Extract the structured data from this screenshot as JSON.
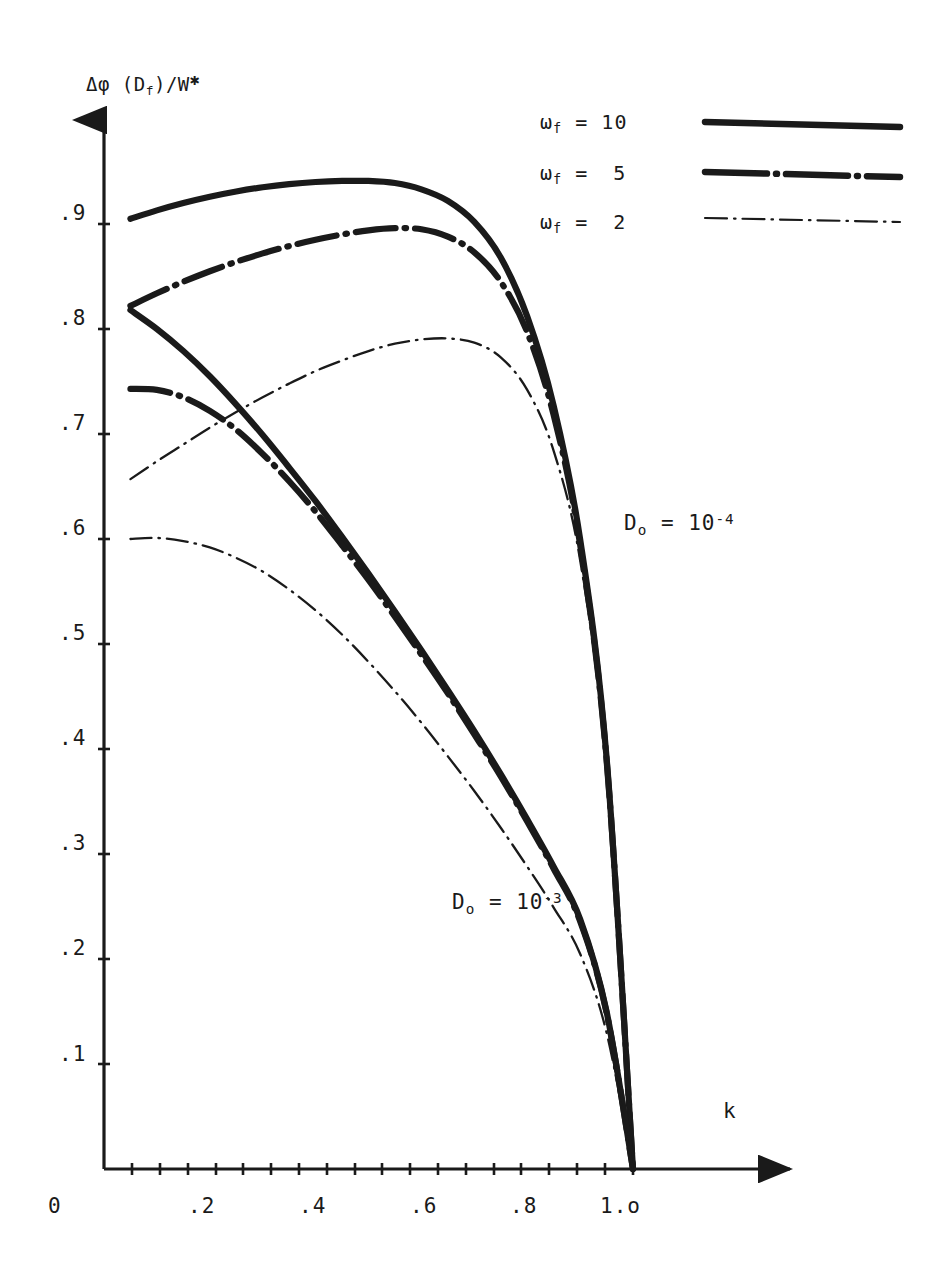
{
  "figure": {
    "width": 939,
    "height": 1277,
    "background": "#ffffff",
    "ink_color": "#1a1a1a"
  },
  "axis": {
    "y_label_prefix": "Δφ (D",
    "y_label_sub": "f",
    "y_label_mid": ")/W",
    "y_label_star": "✱",
    "x_label": "k",
    "origin_label": "0"
  },
  "chart_data": {
    "type": "line",
    "title": "",
    "xlabel": "k",
    "ylabel": "Δφ (D_f)/W*",
    "xlim": [
      0,
      1.15
    ],
    "ylim": [
      0,
      1.0
    ],
    "grid": false,
    "legend_position": "top-right",
    "x_ticks": [
      0,
      0.2,
      0.4,
      0.6,
      0.8,
      1.0
    ],
    "x_tick_labels": [
      "0",
      ".2",
      ".4",
      ".6",
      ".8",
      "1.o"
    ],
    "x_minor_tick_step": 0.05,
    "y_ticks": [
      0.1,
      0.2,
      0.3,
      0.4,
      0.5,
      0.6,
      0.7,
      0.8,
      0.9
    ],
    "y_tick_labels": [
      ".1",
      ".2",
      ".3",
      ".4",
      ".5",
      ".6",
      ".7",
      ".8",
      ".9"
    ],
    "annotations": [
      {
        "id": "annot-d0-1e-4",
        "text_prefix": "D",
        "text_sub": "o",
        "text_mid": " = 10",
        "text_sup": "-4",
        "x_px": 624,
        "y_px": 512
      },
      {
        "id": "annot-d0-1e-3",
        "text_prefix": "D",
        "text_sub": "o",
        "text_mid": " = 10",
        "text_sup": "-3",
        "x_px": 452,
        "y_px": 891
      }
    ],
    "legend": [
      {
        "label_prefix": "ω",
        "label_sub": "f",
        "label_eq": " = ",
        "label_value": "10",
        "style": "solid-thick",
        "width": 6.5
      },
      {
        "label_prefix": "ω",
        "label_sub": "f",
        "label_eq": " = ",
        "label_value": "5",
        "style": "dashdot-thick",
        "width": 6.5
      },
      {
        "label_prefix": "ω",
        "label_sub": "f",
        "label_eq": " = ",
        "label_value": "2",
        "style": "dashdot-thin",
        "width": 2.2
      }
    ],
    "series": [
      {
        "name": "omega_f = 10, D_o = 1e-4",
        "style": "solid-thick",
        "group": "D_o = 10^-4",
        "x": [
          0.05,
          0.1,
          0.15,
          0.2,
          0.25,
          0.3,
          0.35,
          0.4,
          0.45,
          0.5,
          0.55,
          0.6,
          0.65,
          0.7,
          0.75,
          0.8,
          0.85,
          0.9,
          0.95,
          1.0
        ],
        "y": [
          0.905,
          0.913,
          0.92,
          0.926,
          0.931,
          0.935,
          0.938,
          0.94,
          0.941,
          0.941,
          0.939,
          0.933,
          0.922,
          0.902,
          0.868,
          0.812,
          0.727,
          0.6,
          0.392,
          0.0
        ]
      },
      {
        "name": "omega_f = 5, D_o = 1e-4",
        "style": "dashdot-thick",
        "group": "D_o = 10^-4",
        "x": [
          0.05,
          0.1,
          0.15,
          0.2,
          0.25,
          0.3,
          0.35,
          0.4,
          0.45,
          0.5,
          0.55,
          0.6,
          0.65,
          0.7,
          0.75,
          0.8,
          0.85,
          0.9,
          0.95,
          1.0
        ],
        "y": [
          0.822,
          0.834,
          0.845,
          0.855,
          0.864,
          0.872,
          0.879,
          0.885,
          0.89,
          0.894,
          0.896,
          0.895,
          0.888,
          0.873,
          0.845,
          0.797,
          0.718,
          0.595,
          0.39,
          0.0
        ]
      },
      {
        "name": "omega_f = 2, D_o = 1e-4",
        "style": "dashdot-thin",
        "group": "D_o = 10^-4",
        "x": [
          0.05,
          0.1,
          0.15,
          0.2,
          0.25,
          0.3,
          0.35,
          0.4,
          0.45,
          0.5,
          0.55,
          0.6,
          0.65,
          0.7,
          0.75,
          0.8,
          0.85,
          0.9,
          0.95,
          1.0
        ],
        "y": [
          0.657,
          0.674,
          0.69,
          0.706,
          0.721,
          0.735,
          0.748,
          0.76,
          0.77,
          0.779,
          0.786,
          0.79,
          0.791,
          0.787,
          0.773,
          0.742,
          0.684,
          0.58,
          0.38,
          0.0
        ]
      },
      {
        "name": "omega_f = 10, D_o = 1e-3",
        "style": "solid-thick",
        "group": "D_o = 10^-3",
        "x": [
          0.05,
          0.1,
          0.15,
          0.2,
          0.25,
          0.3,
          0.35,
          0.4,
          0.45,
          0.5,
          0.55,
          0.6,
          0.65,
          0.7,
          0.75,
          0.8,
          0.85,
          0.9,
          0.95,
          1.0
        ],
        "y": [
          0.818,
          0.8,
          0.779,
          0.755,
          0.728,
          0.699,
          0.668,
          0.636,
          0.602,
          0.567,
          0.531,
          0.494,
          0.456,
          0.417,
          0.376,
          0.333,
          0.288,
          0.238,
          0.15,
          0.0
        ]
      },
      {
        "name": "omega_f = 5, D_o = 1e-3",
        "style": "dashdot-thick",
        "group": "D_o = 10^-3",
        "x": [
          0.05,
          0.1,
          0.15,
          0.2,
          0.25,
          0.3,
          0.35,
          0.4,
          0.45,
          0.5,
          0.55,
          0.6,
          0.65,
          0.7,
          0.75,
          0.8,
          0.85,
          0.9,
          0.95,
          1.0
        ],
        "y": [
          0.743,
          0.742,
          0.735,
          0.722,
          0.704,
          0.681,
          0.655,
          0.626,
          0.594,
          0.561,
          0.526,
          0.49,
          0.453,
          0.414,
          0.374,
          0.331,
          0.286,
          0.236,
          0.149,
          0.0
        ]
      },
      {
        "name": "omega_f = 2, D_o = 1e-3",
        "style": "dashdot-thin",
        "group": "D_o = 10^-3",
        "x": [
          0.05,
          0.1,
          0.15,
          0.2,
          0.25,
          0.3,
          0.35,
          0.4,
          0.45,
          0.5,
          0.55,
          0.6,
          0.65,
          0.7,
          0.75,
          0.8,
          0.85,
          0.9,
          0.95,
          1.0
        ],
        "y": [
          0.6,
          0.601,
          0.598,
          0.592,
          0.582,
          0.569,
          0.552,
          0.532,
          0.509,
          0.483,
          0.455,
          0.425,
          0.393,
          0.36,
          0.325,
          0.288,
          0.249,
          0.205,
          0.13,
          0.0
        ]
      }
    ]
  }
}
